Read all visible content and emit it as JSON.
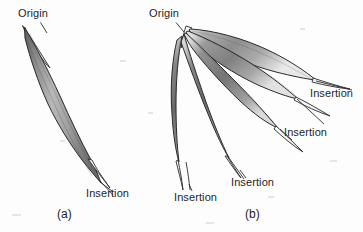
{
  "figure": {
    "background_color": "#fdfdfd",
    "ink_color": "#1d1d1d",
    "muscle_fill_color": "#8a8a8a",
    "muscle_highlight_color": "#d8d8d8",
    "muscle_shadow_color": "#5a5a5a",
    "tendon_color": "#f2f2f2"
  },
  "panels": [
    {
      "id": "a",
      "caption": "(a)",
      "type": "fusiform",
      "labels": [
        {
          "name": "origin",
          "text": "Origin"
        },
        {
          "name": "insertion",
          "text": "Insertion"
        }
      ]
    },
    {
      "id": "b",
      "caption": "(b)",
      "type": "multipennate-radiating",
      "labels": [
        {
          "name": "origin",
          "text": "Origin"
        },
        {
          "name": "insertion-upper-right",
          "text": "Insertion"
        },
        {
          "name": "insertion-middle-right",
          "text": "Insertion"
        },
        {
          "name": "insertion-lower-middle",
          "text": "Insertion"
        },
        {
          "name": "insertion-lower-left",
          "text": "Insertion"
        }
      ]
    }
  ]
}
